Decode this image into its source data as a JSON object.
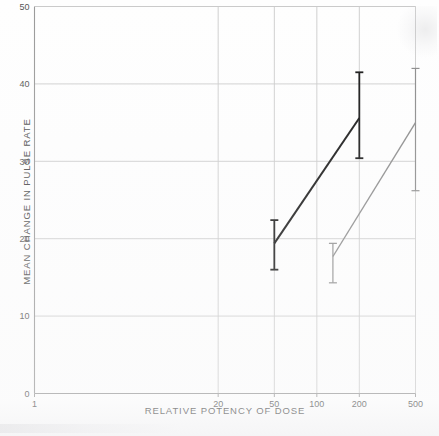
{
  "chart_data": {
    "type": "line",
    "title": "",
    "subtitle": "",
    "xlabel": "RELATIVE POTENCY OF DOSE",
    "ylabel": "MEAN CHANGE IN PULSE RATE",
    "xscale": "log",
    "xlim": [
      1,
      500
    ],
    "ylim": [
      0,
      50
    ],
    "grid": true,
    "legend": "none",
    "xticks": [
      1,
      20,
      50,
      100,
      200,
      500
    ],
    "xtick_labels": [
      "1",
      "20",
      "50",
      "100",
      "200",
      "500"
    ],
    "yticks": [
      0,
      10,
      20,
      30,
      40,
      50
    ],
    "ytick_labels": [
      "0",
      "10",
      "20",
      "30",
      "40",
      "50"
    ],
    "series": [
      {
        "name": "series-black",
        "color": "#141414",
        "x": [
          50,
          200
        ],
        "values": [
          19.4,
          35.6
        ],
        "errors_low": [
          16.0,
          30.4
        ],
        "errors_high": [
          22.4,
          41.5
        ]
      },
      {
        "name": "series-grey",
        "color": "#8a8a8a",
        "x": [
          130,
          500
        ],
        "values": [
          17.7,
          35.0
        ],
        "errors_low": [
          14.3,
          26.2
        ],
        "errors_high": [
          19.4,
          42.0
        ]
      }
    ]
  },
  "axes": {
    "y_title": "MEAN CHANGE IN PULSE RATE",
    "x_title": "RELATIVE POTENCY OF DOSE"
  }
}
